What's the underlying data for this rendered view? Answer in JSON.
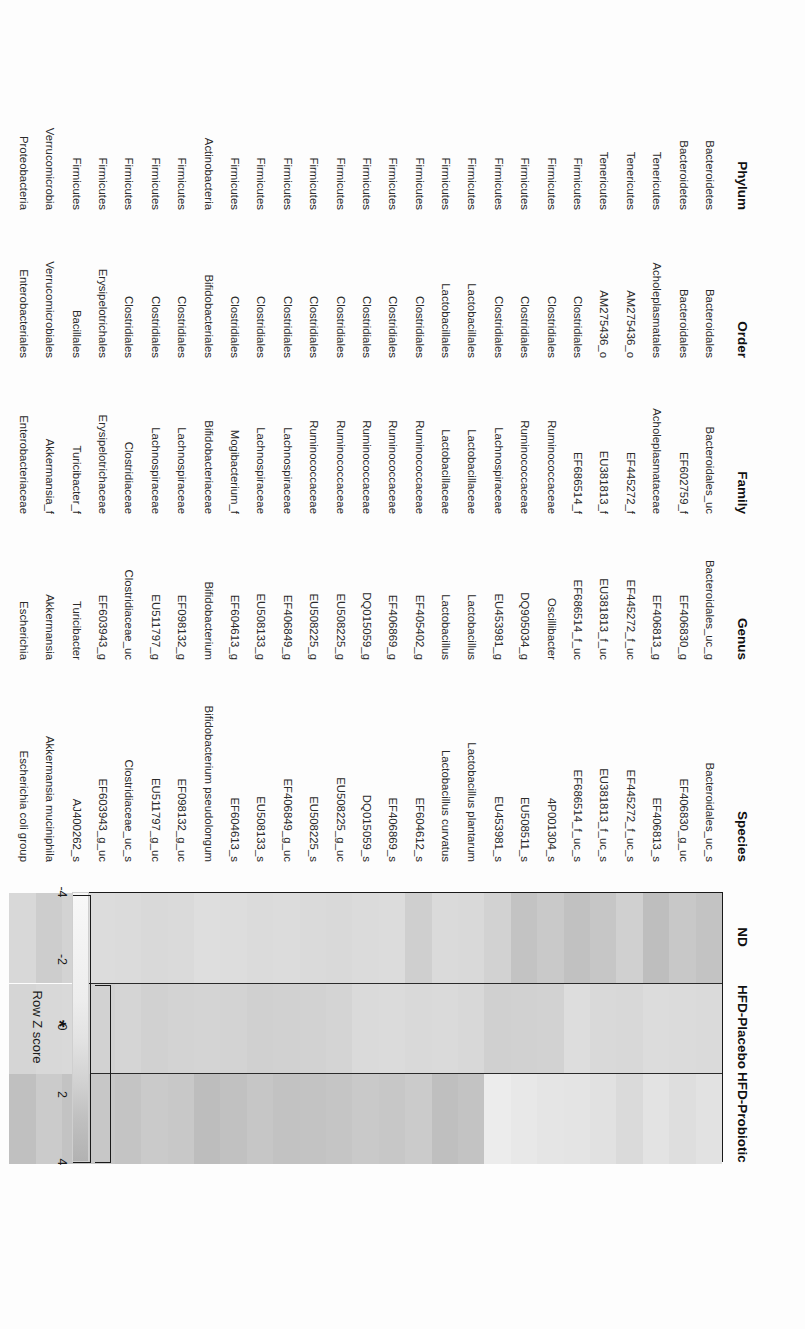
{
  "figure": {
    "orientation": "rotated-90-cw",
    "table_headers": {
      "phylum": "Phylum",
      "order": "Order",
      "family": "Family",
      "genus": "Genus",
      "species": "Species"
    },
    "groups": [
      {
        "id": "nd",
        "label": "ND"
      },
      {
        "id": "hfd_placebo",
        "label": "HFD-Placebo"
      },
      {
        "id": "hfd_probiotic",
        "label": "HFD-Probiotic"
      }
    ],
    "colorbar": {
      "title": "Row Z score",
      "ticks": [
        "-4",
        "-2",
        "0",
        "2",
        "4"
      ],
      "min": -4,
      "max": 4,
      "low_color": "#f8f8f8",
      "high_color": "#b2b2b2"
    },
    "annotations": {
      "significance_marker": "*"
    }
  },
  "chart_data": {
    "type": "heatmap",
    "title": "",
    "xlabel": "",
    "ylabel": "",
    "legend_position": "bottom-left",
    "grid": false,
    "colorbar_label": "Row Z score",
    "zlim": [
      -4,
      4
    ],
    "columns": [
      "ND",
      "HFD-Placebo",
      "HFD-Probiotic"
    ],
    "rows": [
      {
        "phylum": "Bacteroidetes",
        "order": "Bacteroidales",
        "family": "Bacteroidales_uc",
        "genus": "Bacteroidales_uc_g",
        "species": "Bacteroidales_uc_s",
        "values": [
          1.9,
          -0.4,
          -1.2
        ]
      },
      {
        "phylum": "Bacteroidetes",
        "order": "Bacteroidales",
        "family": "EF602759_f",
        "genus": "EF406830_g",
        "species": "EF406830_g_uc",
        "values": [
          1.4,
          -0.5,
          -0.8
        ]
      },
      {
        "phylum": "Tenericutes",
        "order": "Acholeplasmatales",
        "family": "Acholeplasmataceae",
        "genus": "EF406813_g",
        "species": "EF406813_s",
        "values": [
          2.5,
          -0.6,
          -1.3
        ]
      },
      {
        "phylum": "Tenericutes",
        "order": "AM275436_o",
        "family": "EF445272_f",
        "genus": "EF445272_f_uc",
        "species": "EF445272_f_uc_s",
        "values": [
          0.6,
          -0.2,
          -0.4
        ]
      },
      {
        "phylum": "Tenericutes",
        "order": "AM275436_o",
        "family": "EU381813_f",
        "genus": "EU381813_f_uc",
        "species": "EU381813_f_uc_s",
        "values": [
          1.6,
          -0.3,
          -1.1
        ]
      },
      {
        "phylum": "Firmicutes",
        "order": "Clostridiales",
        "family": "EF686514_f",
        "genus": "EF686514_f_uc",
        "species": "EF686514_f_uc_s",
        "values": [
          2.2,
          -0.7,
          -1.4
        ]
      },
      {
        "phylum": "Firmicutes",
        "order": "Clostridiales",
        "family": "Ruminococcaceae",
        "genus": "Oscillibacter",
        "species": "4P001304_s",
        "values": [
          1.3,
          0.4,
          -1.5
        ]
      },
      {
        "phylum": "Firmicutes",
        "order": "Clostridiales",
        "family": "Ruminococcaceae",
        "genus": "DQ905034_g",
        "species": "EU508511_s",
        "values": [
          2.0,
          0.5,
          -1.8
        ]
      },
      {
        "phylum": "Firmicutes",
        "order": "Clostridiales",
        "family": "Lachnospiraceae",
        "genus": "EU453981_g",
        "species": "EU453981_s",
        "values": [
          0.4,
          0.6,
          -2.3
        ]
      },
      {
        "phylum": "Firmicutes",
        "order": "Lactobacillales",
        "family": "Lactobacillaceae",
        "genus": "Lactobacillus",
        "species": "Lactobacillus plantarum",
        "values": [
          -0.3,
          -0.2,
          2.0
        ]
      },
      {
        "phylum": "Firmicutes",
        "order": "Lactobacillales",
        "family": "Lactobacillaceae",
        "genus": "Lactobacillus",
        "species": "Lactobacillus curvatus",
        "values": [
          -0.4,
          -0.4,
          2.4
        ]
      },
      {
        "phylum": "Firmicutes",
        "order": "Clostridiales",
        "family": "Ruminococcaceae",
        "genus": "EF405402_g",
        "species": "EF604612_s",
        "values": [
          0.7,
          -0.3,
          1.1
        ]
      },
      {
        "phylum": "Firmicutes",
        "order": "Clostridiales",
        "family": "Ruminococcaceae",
        "genus": "EF406869_g",
        "species": "EF406869_s",
        "values": [
          -0.6,
          -0.5,
          1.5
        ]
      },
      {
        "phylum": "Firmicutes",
        "order": "Clostridiales",
        "family": "Ruminococcaceae",
        "genus": "DQ015059_g",
        "species": "DQ015059_s",
        "values": [
          -0.5,
          -0.4,
          1.3
        ]
      },
      {
        "phylum": "Firmicutes",
        "order": "Clostridiales",
        "family": "Ruminococcaceae",
        "genus": "EU508225_g",
        "species": "EU508225_g_uc",
        "values": [
          -0.3,
          0.2,
          1.7
        ]
      },
      {
        "phylum": "Firmicutes",
        "order": "Clostridiales",
        "family": "Ruminococcaceae",
        "genus": "EU508225_g",
        "species": "EU508225_s",
        "values": [
          -0.4,
          0.4,
          1.9
        ]
      },
      {
        "phylum": "Firmicutes",
        "order": "Clostridiales",
        "family": "Lachnospiraceae",
        "genus": "EF406849_g",
        "species": "EF406849_g_uc",
        "values": [
          -0.6,
          0.5,
          2.1
        ]
      },
      {
        "phylum": "Firmicutes",
        "order": "Clostridiales",
        "family": "Lachnospiraceae",
        "genus": "EU508133_g",
        "species": "EU508133_s",
        "values": [
          -0.5,
          0.6,
          1.6
        ]
      },
      {
        "phylum": "Firmicutes",
        "order": "Clostridiales",
        "family": "Mogibacterium_f",
        "genus": "EF604613_g",
        "species": "EF604613_s",
        "values": [
          -0.7,
          0.3,
          2.2
        ]
      },
      {
        "phylum": "Actinobacteria",
        "order": "Bifidobacteriales",
        "family": "Bifidobacteriaceae",
        "genus": "Bifidobacterium",
        "species": "Bifidobacterium pseudolongum",
        "values": [
          -0.8,
          0.2,
          2.6
        ]
      },
      {
        "phylum": "Firmicutes",
        "order": "Clostridiales",
        "family": "Lachnospiraceae",
        "genus": "EF098132_g",
        "species": "EF098132_g_uc",
        "values": [
          -0.4,
          0.3,
          1.4
        ]
      },
      {
        "phylum": "Firmicutes",
        "order": "Clostridiales",
        "family": "Lachnospiraceae",
        "genus": "EU511797_g",
        "species": "EU511797_g_uc",
        "values": [
          -0.3,
          0.5,
          1.2
        ]
      },
      {
        "phylum": "Firmicutes",
        "order": "Clostridiales",
        "family": "Clostridiaceae",
        "genus": "Clostridiaceae_uc",
        "species": "Clostridiaceae_uc_s",
        "values": [
          -0.5,
          0.1,
          1.8
        ]
      },
      {
        "phylum": "Firmicutes",
        "order": "Erysipelotrichales",
        "family": "Erysipelotrichaceae",
        "genus": "EF603943_g",
        "species": "EF603943_g_uc",
        "values": [
          -0.6,
          0.4,
          1.5
        ]
      },
      {
        "phylum": "Firmicutes",
        "order": "Bacillales",
        "family": "Turicibacter_f",
        "genus": "Turicibacter",
        "species": "AJ400262_s",
        "values": [
          0.3,
          -0.3,
          1.9
        ]
      },
      {
        "phylum": "Verrucomicrobia",
        "order": "Verrucomicrobiales",
        "family": "Akkermansia_f",
        "genus": "Akkermansia",
        "species": "Akkermansia muciniphila",
        "values": [
          0.9,
          -0.2,
          1.1
        ]
      },
      {
        "phylum": "Proteobacteria",
        "order": "Enterobacteriales",
        "family": "Enterobacteriaceae",
        "genus": "Escherichia",
        "species": "Escherichia coli group",
        "values": [
          -0.2,
          0.1,
          2.3
        ]
      }
    ]
  }
}
